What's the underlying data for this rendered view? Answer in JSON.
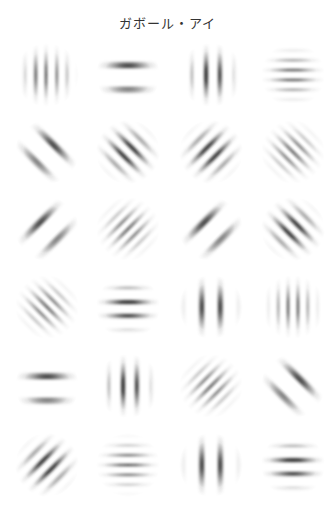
{
  "title": "ガボール・アイ",
  "colors": {
    "background": "#ffffff",
    "stripe": "#1a1a1a",
    "title": "#333333"
  },
  "grid": {
    "rows": 6,
    "cols": 4,
    "col_centers_x": [
      47,
      128,
      211,
      293
    ],
    "row_centers_y": [
      75,
      152,
      229,
      307,
      386,
      465
    ],
    "patches": [
      {
        "row": 0,
        "col": 0,
        "orientation": "vertical",
        "angle": 0,
        "stripes": 4,
        "period": 9,
        "phase": "dark-pair-center"
      },
      {
        "row": 0,
        "col": 1,
        "orientation": "horizontal",
        "angle": 90,
        "stripes": 2,
        "period": 20,
        "phase": "dark-pair-center"
      },
      {
        "row": 0,
        "col": 2,
        "orientation": "vertical",
        "angle": 0,
        "stripes": 4,
        "period": 13,
        "phase": "dark-pair-center"
      },
      {
        "row": 0,
        "col": 3,
        "orientation": "horizontal",
        "angle": 90,
        "stripes": 4,
        "period": 10,
        "phase": "dark-pair-center"
      },
      {
        "row": 1,
        "col": 0,
        "orientation": "diagonal-backslash",
        "angle": 135,
        "stripes": 2,
        "period": 20,
        "phase": "dark-pair-center"
      },
      {
        "row": 1,
        "col": 1,
        "orientation": "diagonal-backslash",
        "angle": 135,
        "stripes": 4,
        "period": 12,
        "phase": "dark-pair-center"
      },
      {
        "row": 1,
        "col": 2,
        "orientation": "diagonal-slash",
        "angle": 45,
        "stripes": 4,
        "period": 12,
        "phase": "dark-pair-center"
      },
      {
        "row": 1,
        "col": 3,
        "orientation": "diagonal-backslash",
        "angle": 135,
        "stripes": 5,
        "period": 9,
        "phase": "dark-center"
      },
      {
        "row": 2,
        "col": 0,
        "orientation": "diagonal-slash",
        "angle": 45,
        "stripes": 2,
        "period": 20,
        "phase": "dark-pair-center"
      },
      {
        "row": 2,
        "col": 1,
        "orientation": "diagonal-slash",
        "angle": 45,
        "stripes": 5,
        "period": 9,
        "phase": "dark-center"
      },
      {
        "row": 2,
        "col": 2,
        "orientation": "diagonal-slash",
        "angle": 45,
        "stripes": 2,
        "period": 20,
        "phase": "dark-pair-center"
      },
      {
        "row": 2,
        "col": 3,
        "orientation": "diagonal-backslash",
        "angle": 135,
        "stripes": 4,
        "period": 12,
        "phase": "dark-pair-center"
      },
      {
        "row": 3,
        "col": 0,
        "orientation": "diagonal-backslash",
        "angle": 135,
        "stripes": 5,
        "period": 9,
        "phase": "dark-center"
      },
      {
        "row": 3,
        "col": 1,
        "orientation": "horizontal",
        "angle": 90,
        "stripes": 4,
        "period": 13,
        "phase": "dark-pair-center"
      },
      {
        "row": 3,
        "col": 2,
        "orientation": "vertical",
        "angle": 0,
        "stripes": 2,
        "period": 19,
        "phase": "dark-pair-center"
      },
      {
        "row": 3,
        "col": 3,
        "orientation": "vertical",
        "angle": 0,
        "stripes": 4,
        "period": 10,
        "phase": "dark-pair-center"
      },
      {
        "row": 4,
        "col": 0,
        "orientation": "horizontal",
        "angle": 90,
        "stripes": 2,
        "period": 20,
        "phase": "dark-pair-center"
      },
      {
        "row": 4,
        "col": 1,
        "orientation": "vertical",
        "angle": 0,
        "stripes": 4,
        "period": 13,
        "phase": "dark-pair-center"
      },
      {
        "row": 4,
        "col": 2,
        "orientation": "diagonal-slash",
        "angle": 45,
        "stripes": 5,
        "period": 9,
        "phase": "dark-center"
      },
      {
        "row": 4,
        "col": 3,
        "orientation": "diagonal-backslash",
        "angle": 135,
        "stripes": 2,
        "period": 20,
        "phase": "dark-pair-center"
      },
      {
        "row": 5,
        "col": 0,
        "orientation": "diagonal-slash",
        "angle": 45,
        "stripes": 4,
        "period": 12,
        "phase": "dark-pair-center"
      },
      {
        "row": 5,
        "col": 1,
        "orientation": "horizontal",
        "angle": 90,
        "stripes": 5,
        "period": 10,
        "phase": "dark-center"
      },
      {
        "row": 5,
        "col": 2,
        "orientation": "vertical",
        "angle": 0,
        "stripes": 2,
        "period": 19,
        "phase": "dark-pair-center"
      },
      {
        "row": 5,
        "col": 3,
        "orientation": "horizontal",
        "angle": 90,
        "stripes": 4,
        "period": 13,
        "phase": "dark-pair-center"
      }
    ]
  }
}
